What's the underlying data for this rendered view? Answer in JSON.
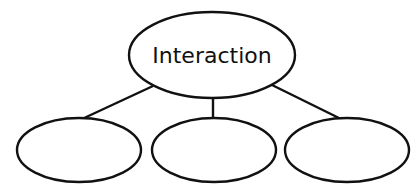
{
  "diagram": {
    "type": "concept-map",
    "root": {
      "label": "Interaction",
      "center": [
        212,
        55
      ],
      "rx": 83,
      "ry": 43
    },
    "children": [
      {
        "label": "",
        "center": [
          79,
          150
        ],
        "rx": 62,
        "ry": 32
      },
      {
        "label": "",
        "center": [
          214,
          150
        ],
        "rx": 62,
        "ry": 32
      },
      {
        "label": "",
        "center": [
          347,
          150
        ],
        "rx": 62,
        "ry": 32
      }
    ],
    "edges": [
      {
        "from": "root",
        "to": 0
      },
      {
        "from": "root",
        "to": 1
      },
      {
        "from": "root",
        "to": 2
      }
    ],
    "colors": {
      "stroke": "#111111",
      "fill": "#ffffff",
      "background": "#ffffff"
    }
  }
}
